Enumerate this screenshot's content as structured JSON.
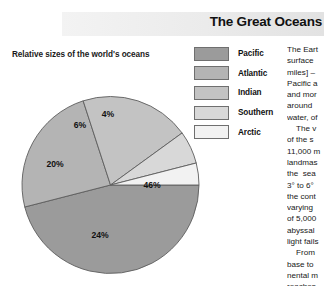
{
  "header": {
    "title": "The Great Oceans",
    "band_color": "#ebebeb"
  },
  "chart_caption": "Relative sizes of the world's oceans",
  "legend": {
    "items": [
      {
        "label": "Pacific",
        "color": "#9b9b9b"
      },
      {
        "label": "Atlantic",
        "color": "#b4b4b4"
      },
      {
        "label": "Indian",
        "color": "#c3c3c3"
      },
      {
        "label": "Southern",
        "color": "#d8d8d8"
      },
      {
        "label": "Arctic",
        "color": "#f2f2f2"
      }
    ]
  },
  "chart_data": {
    "type": "pie",
    "title": "Relative sizes of the world's oceans",
    "labels": [
      "Pacific",
      "Atlantic",
      "Indian",
      "Southern",
      "Arctic"
    ],
    "values": [
      46,
      24,
      20,
      6,
      4
    ],
    "value_labels": [
      "46%",
      "24%",
      "20%",
      "6%",
      "4%"
    ],
    "colors": [
      "#9b9b9b",
      "#b4b4b4",
      "#c3c3c3",
      "#d8d8d8",
      "#f2f2f2"
    ],
    "unit": "%",
    "legend_position": "top-right",
    "start_angle_deg": 0,
    "direction": "clockwise",
    "label_points": [
      {
        "text": "46%",
        "x": 152,
        "y": 188
      },
      {
        "text": "24%",
        "x": 100,
        "y": 238
      },
      {
        "text": "20%",
        "x": 55,
        "y": 167
      },
      {
        "text": "6%",
        "x": 80,
        "y": 128
      },
      {
        "text": "4%",
        "x": 108,
        "y": 117
      }
    ]
  },
  "body_text": {
    "paragraphs": [
      "The Eart\nsurface \nmiles] –\nPacific a\nand mor\naround \nwater, of",
      "The v\nof the s\n11,000 m\nlandmas\nthe  sea\n3° to 6° \nthe cont\nvarying \nof 5,000\nabyssal \nlight fails",
      "From \nbase to \nnental m\nreaches"
    ]
  }
}
